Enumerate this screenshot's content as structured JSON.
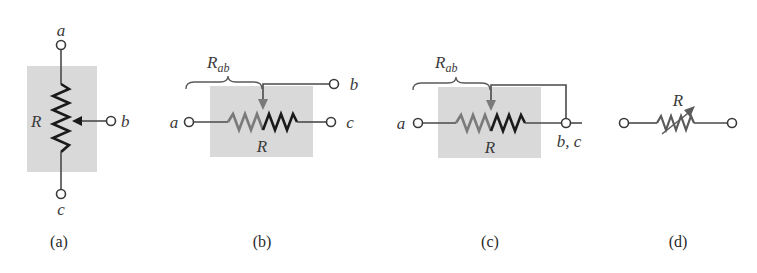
{
  "figure": {
    "panels": [
      {
        "id": "a",
        "caption": "(a)",
        "description": "Potentiometer, vertical orientation with wiper arrow from the right",
        "labels": {
          "top_terminal": "a",
          "wiper_terminal": "b",
          "bottom_terminal": "c",
          "resistor": "R"
        }
      },
      {
        "id": "b",
        "caption": "(b)",
        "description": "Potentiometer, horizontal; wiper b from above, resistance Rab spans a to wiper",
        "labels": {
          "left_terminal": "a",
          "wiper_terminal": "b",
          "right_terminal": "c",
          "resistor": "R",
          "brace_label": "R",
          "brace_sub": "ab"
        }
      },
      {
        "id": "c",
        "caption": "(c)",
        "description": "Potentiometer wired as rheostat; wiper b shorted to terminal c",
        "labels": {
          "left_terminal": "a",
          "right_terminal": "b, c",
          "resistor": "R",
          "brace_label": "R",
          "brace_sub": "ab"
        }
      },
      {
        "id": "d",
        "caption": "(d)",
        "description": "Variable resistor (rheostat) schematic symbol",
        "labels": {
          "resistor": "R"
        }
      }
    ],
    "colors": {
      "shaded_box": "#d9d9d9",
      "wire": "#4a4a4a",
      "resistor_dark": "#1a1a1a",
      "resistor_grey": "#7a7a7a",
      "text": "#3a3a3a"
    }
  }
}
